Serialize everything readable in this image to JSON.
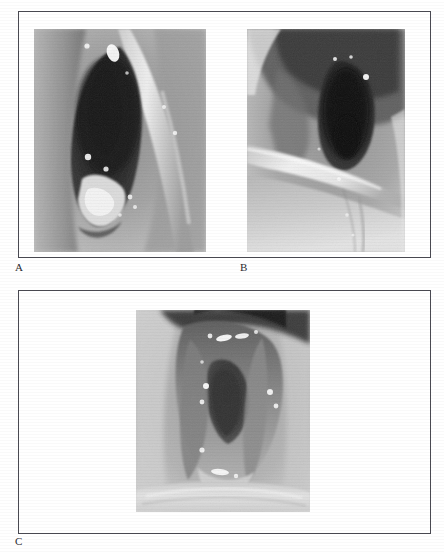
{
  "figure": {
    "kind": "medical-photo-plate",
    "background_color": "#ffffff",
    "frame_color": "#4a4a52",
    "panel_count": 3,
    "panels": [
      {
        "id": "a",
        "caption": "A",
        "modality": "laryngoscopy",
        "description": "Endoscopic view of a vertically elongated dark airway opening with pale mucosal walls and bright specular highlights along the lower rim",
        "orientation": "portrait",
        "tone": "grayscale"
      },
      {
        "id": "b",
        "caption": "B",
        "modality": "laryngoscopy",
        "description": "Oblique endoscopic view of a dark rounded opening in the upper right with a bright diagonal mucosal band crossing the lower half",
        "orientation": "portrait",
        "tone": "grayscale"
      },
      {
        "id": "c",
        "caption": "C",
        "modality": "laryngoscopy",
        "description": "Endoscopic view of a V-shaped glottic aperture bordered by folds studded with bright specular highlights, pale tissue below",
        "orientation": "portrait",
        "tone": "grayscale"
      }
    ],
    "plates": [
      {
        "id": "top",
        "contains": [
          "A",
          "B"
        ]
      },
      {
        "id": "bottom",
        "contains": [
          "C"
        ]
      }
    ]
  }
}
